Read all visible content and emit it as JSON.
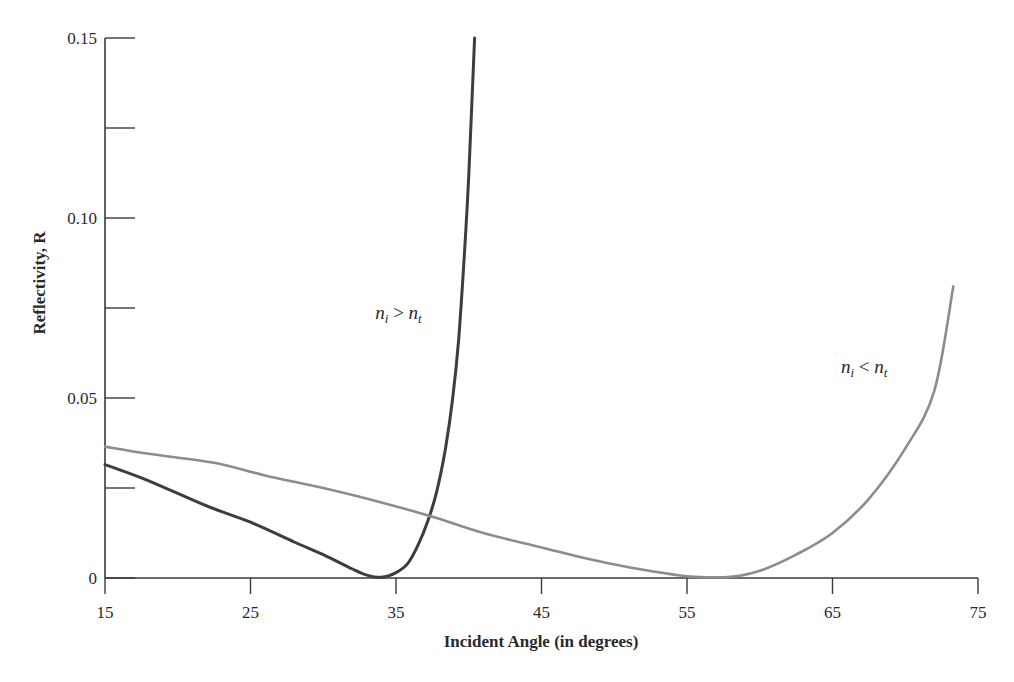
{
  "chart_data": {
    "type": "line",
    "title": "",
    "xlabel": "Incident Angle (in degrees)",
    "ylabel": "Reflectivity, R",
    "xlim": [
      15,
      75
    ],
    "ylim": [
      0,
      0.15
    ],
    "grid": false,
    "legend": null,
    "x_ticks": [
      15,
      25,
      35,
      45,
      55,
      65,
      75
    ],
    "x_tick_labels": [
      "15",
      "25",
      "35",
      "45",
      "55",
      "65",
      "75"
    ],
    "y_ticks": [
      0,
      0.05,
      0.1,
      0.15
    ],
    "y_tick_labels": [
      "0",
      "0.05",
      "0.10",
      "0.15"
    ],
    "y_minor_ticks": [
      0.025,
      0.075,
      0.125
    ],
    "series": [
      {
        "name": "n_i > n_t",
        "color": "#3d3d3d",
        "label_position": {
          "x": 35.5,
          "y": 0.072
        },
        "x": [
          15,
          18,
          22,
          25,
          28,
          30,
          32,
          33,
          34,
          35,
          35.8,
          36.5,
          37.2,
          37.8,
          38.4,
          38.9,
          39.3,
          39.7,
          40.0,
          40.4
        ],
        "y": [
          0.0315,
          0.027,
          0.02,
          0.0155,
          0.01,
          0.0065,
          0.0025,
          0.0008,
          0.0002,
          0.0015,
          0.004,
          0.009,
          0.016,
          0.024,
          0.036,
          0.05,
          0.066,
          0.09,
          0.112,
          0.15
        ]
      },
      {
        "name": "n_i < n_t",
        "color": "#8c8c8c",
        "label_position": {
          "x": 67.5,
          "y": 0.057
        },
        "x": [
          15,
          18,
          22.5,
          26,
          30,
          34,
          37.5,
          41,
          45,
          48,
          51,
          54,
          55.5,
          58,
          60,
          62.5,
          65,
          67.5,
          70,
          72,
          73.3
        ],
        "y": [
          0.0365,
          0.0345,
          0.032,
          0.0285,
          0.025,
          0.021,
          0.017,
          0.0125,
          0.0085,
          0.0055,
          0.003,
          0.001,
          0.0003,
          0.0003,
          0.002,
          0.0065,
          0.0125,
          0.022,
          0.036,
          0.052,
          0.081
        ]
      }
    ]
  },
  "annotations": {
    "left_curve": {
      "base1": "n",
      "sub1": "i",
      "op": " > ",
      "base2": "n",
      "sub2": "t"
    },
    "right_curve": {
      "base1": "n",
      "sub1": "i",
      "op": " < ",
      "base2": "n",
      "sub2": "t"
    }
  },
  "layout": {
    "plot": {
      "x0": 105,
      "x1": 978,
      "y_top": 38,
      "y_bottom": 578
    },
    "axis_color": "#3a3a3a"
  }
}
